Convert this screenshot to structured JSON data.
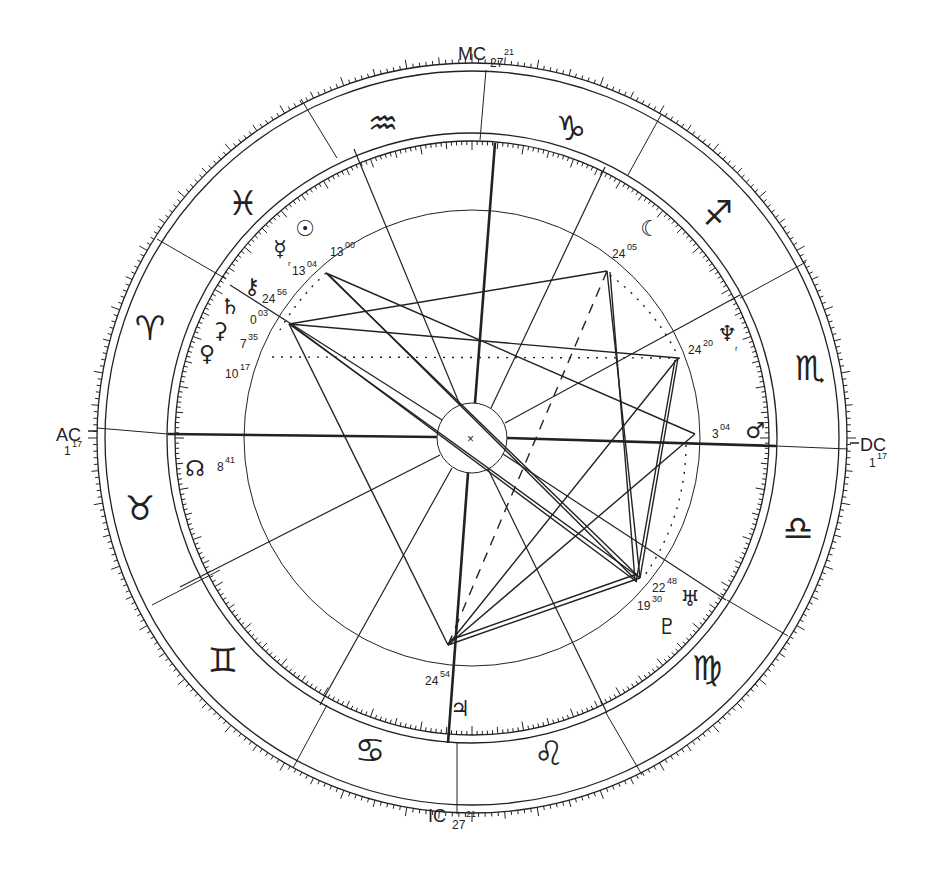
{
  "chart_title": "Natal chart wheel",
  "center": {
    "x": 472,
    "y": 438
  },
  "colors": {
    "ink": "#222222",
    "background": "#ffffff"
  },
  "angles": {
    "mc": {
      "label": "MC",
      "degree": "27",
      "minutes": "21"
    },
    "ic": {
      "label": "IC",
      "degree": "27",
      "minutes": "21"
    },
    "ac": {
      "label": "AC",
      "degree": "1",
      "minutes": "17"
    },
    "dc": {
      "label": "DC",
      "degree": "1",
      "minutes": "17"
    }
  },
  "signs": [
    {
      "name": "aquarius",
      "glyph": "♒",
      "x": 383,
      "y": 125
    },
    {
      "name": "capricorn",
      "glyph": "♑",
      "x": 571,
      "y": 130
    },
    {
      "name": "sagittarius",
      "glyph": "♐",
      "x": 718,
      "y": 215
    },
    {
      "name": "scorpio",
      "glyph": "♏",
      "x": 810,
      "y": 370
    },
    {
      "name": "libra",
      "glyph": "♎",
      "x": 798,
      "y": 530
    },
    {
      "name": "virgo",
      "glyph": "♍",
      "x": 707,
      "y": 670
    },
    {
      "name": "leo",
      "glyph": "♌",
      "x": 549,
      "y": 755
    },
    {
      "name": "cancer",
      "glyph": "♋",
      "x": 370,
      "y": 752
    },
    {
      "name": "gemini",
      "glyph": "♊",
      "x": 223,
      "y": 662
    },
    {
      "name": "taurus",
      "glyph": "♉",
      "x": 140,
      "y": 510
    },
    {
      "name": "aries",
      "glyph": "♈",
      "x": 150,
      "y": 330
    },
    {
      "name": "pisces",
      "glyph": "♓",
      "x": 243,
      "y": 205
    }
  ],
  "planets": [
    {
      "name": "sun",
      "glyph": "☉",
      "deg": "13",
      "min": "00",
      "gx": 305,
      "gy": 230,
      "tx": 330,
      "ty": 256
    },
    {
      "name": "mercury",
      "glyph": "☿",
      "retro": "r",
      "deg": "13",
      "min": "04",
      "gx": 280,
      "gy": 250,
      "tx": 292,
      "ty": 275
    },
    {
      "name": "chiron",
      "glyph": "⚷",
      "deg": "24",
      "min": "56",
      "gx": 252,
      "gy": 288,
      "tx": 262,
      "ty": 303
    },
    {
      "name": "saturn",
      "glyph": "♄",
      "deg": "0",
      "min": "03",
      "gx": 230,
      "gy": 308,
      "tx": 250,
      "ty": 324
    },
    {
      "name": "ceres",
      "glyph": "⚳",
      "deg": "7",
      "min": "35",
      "gx": 220,
      "gy": 332,
      "tx": 240,
      "ty": 348
    },
    {
      "name": "venus",
      "glyph": "♀",
      "deg": "10",
      "min": "17",
      "gx": 207,
      "gy": 355,
      "tx": 225,
      "ty": 378
    },
    {
      "name": "node",
      "glyph": "☊",
      "deg": "8",
      "min": "41",
      "gx": 195,
      "gy": 470,
      "tx": 217,
      "ty": 471
    },
    {
      "name": "moon",
      "glyph": "☾",
      "deg": "24",
      "min": "05",
      "gx": 650,
      "gy": 230,
      "tx": 612,
      "ty": 258
    },
    {
      "name": "neptune",
      "glyph": "♆",
      "retro": "r",
      "deg": "24",
      "min": "20",
      "gx": 727,
      "gy": 335,
      "tx": 688,
      "ty": 354
    },
    {
      "name": "mars",
      "glyph": "♂",
      "deg": "3",
      "min": "04",
      "gx": 755,
      "gy": 432,
      "tx": 712,
      "ty": 438
    },
    {
      "name": "uranus",
      "glyph": "♅",
      "deg": "22",
      "min": "48",
      "gx": 690,
      "gy": 600,
      "tx": 652,
      "ty": 592
    },
    {
      "name": "pluto",
      "glyph": "♇",
      "deg": "19",
      "min": "30",
      "gx": 667,
      "gy": 628,
      "tx": 637,
      "ty": 610
    },
    {
      "name": "jupiter",
      "glyph": "♃",
      "deg": "24",
      "min": "54",
      "gx": 460,
      "gy": 710,
      "tx": 425,
      "ty": 685
    }
  ],
  "center_mark": "×"
}
